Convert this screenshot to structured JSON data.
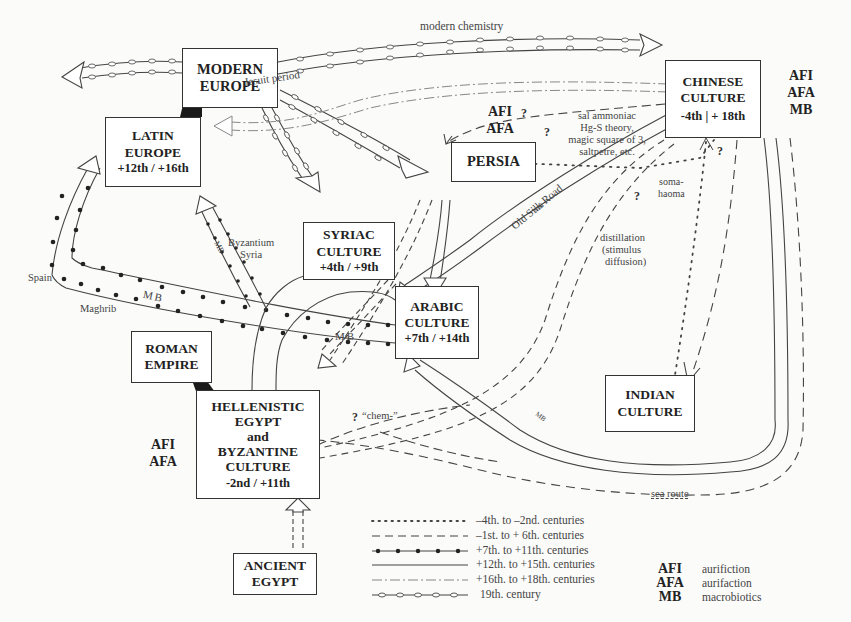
{
  "diagram": {
    "type": "transmission-map",
    "nodes": {
      "modern_europe": {
        "lines": [
          "MODERN",
          "EUROPE"
        ]
      },
      "latin_europe": {
        "lines": [
          "LATIN",
          "EUROPE",
          "+12th / +16th"
        ]
      },
      "chinese": {
        "lines": [
          "CHINESE",
          "CULTURE",
          "-4th | + 18th"
        ],
        "tags": [
          "AFI",
          "AFA",
          "MB"
        ]
      },
      "persia": {
        "lines": [
          "PERSIA"
        ],
        "tags": [
          "AFI",
          "AFA"
        ]
      },
      "syriac": {
        "lines": [
          "SYRIAC",
          "CULTURE",
          "+4th / +9th"
        ]
      },
      "arabic": {
        "lines": [
          "ARABIC",
          "CULTURE",
          "+7th / +14th"
        ]
      },
      "roman": {
        "lines": [
          "ROMAN",
          "EMPIRE"
        ]
      },
      "hellenistic": {
        "lines": [
          "HELLENISTIC",
          "EGYPT",
          "and",
          "BYZANTINE",
          "CULTURE",
          "-2nd / +11th"
        ],
        "tags": [
          "AFI",
          "AFA"
        ]
      },
      "indian": {
        "lines": [
          "INDIAN",
          "CULTURE"
        ]
      },
      "ancient_egypt": {
        "lines": [
          "ANCIENT",
          "EGYPT"
        ]
      }
    },
    "labels": {
      "modern_chemistry": "modern chemistry",
      "jesuit_period": "Jesuit period",
      "transfers": [
        "sal ammoniac",
        "Hg-S theory,",
        "magic square of 3,",
        "saltpetre, etc."
      ],
      "soma": [
        "soma-",
        "haoma"
      ],
      "distillation": [
        "distillation",
        "(stimulus",
        "diffusion)"
      ],
      "old_silk_road": "Old Silk Road",
      "mb": "MB",
      "byzantium_syria": [
        "Byzantium",
        "Syria"
      ],
      "spain": "Spain",
      "maghrib": "Maghrib",
      "chem": "“chem-”",
      "sea_route": "sea route",
      "question": "?"
    },
    "legend": {
      "periods": [
        {
          "style": "dotted",
          "label": "–4th. to –2nd. centuries"
        },
        {
          "style": "dashed",
          "label": "–1st. to + 6th. centuries"
        },
        {
          "style": "dot-beaded",
          "label": "+7th. to +11th. centuries"
        },
        {
          "style": "solid",
          "label": "+12th. to +15th. centuries"
        },
        {
          "style": "dash-dot",
          "label": "+16th. to +18th. centuries"
        },
        {
          "style": "chain-link",
          "label": "19th. century"
        }
      ],
      "abbreviations": [
        {
          "abbr": "AFI",
          "meaning": "aurifiction"
        },
        {
          "abbr": "AFA",
          "meaning": "aurifaction"
        },
        {
          "abbr": "MB",
          "meaning": "macrobiotics"
        }
      ]
    }
  }
}
